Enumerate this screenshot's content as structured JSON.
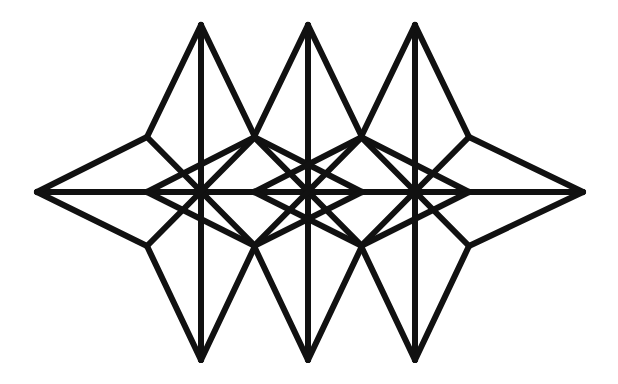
{
  "diagram": {
    "title": "",
    "stroke_color": "#111111",
    "background_color": "#ffffff",
    "star_count": 3
  }
}
